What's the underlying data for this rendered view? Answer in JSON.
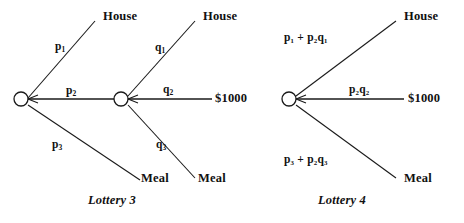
{
  "figure": {
    "background_color": "#ffffff",
    "line_color": "#1a1a1a",
    "text_color": "#111111"
  },
  "lottery3": {
    "caption": "Lottery 3",
    "branches": {
      "top": {
        "prob": "p",
        "prob_sub": "1",
        "outcome": "House"
      },
      "middle": {
        "prob": "p",
        "prob_sub": "2",
        "outcome": ""
      },
      "bottom": {
        "prob": "p",
        "prob_sub": "3",
        "outcome": "Meal"
      }
    },
    "subtree": {
      "top": {
        "prob": "q",
        "prob_sub": "1",
        "outcome": "House"
      },
      "middle": {
        "prob": "q",
        "prob_sub": "2",
        "outcome": "$1000"
      },
      "bottom": {
        "prob": "q",
        "prob_sub": "3",
        "outcome": "Meal"
      }
    }
  },
  "lottery4": {
    "caption": "Lottery 4",
    "branches": {
      "top": {
        "prob_html": "p₁ + p₂q₁",
        "outcome": "House"
      },
      "middle": {
        "prob_html": "p₂q₂",
        "outcome": "$1000"
      },
      "bottom": {
        "prob_html": "p₃ + p₂q₃",
        "outcome": "Meal"
      }
    }
  },
  "labels": {
    "l3_p1": "p",
    "l3_p1_sub": "1",
    "l3_p2": "p",
    "l3_p2_sub": "2",
    "l3_p3": "p",
    "l3_p3_sub": "3",
    "l3_q1": "q",
    "l3_q1_sub": "1",
    "l3_q2": "q",
    "l3_q2_sub": "2",
    "l3_q3": "q",
    "l3_q3_sub": "3",
    "l3_house_mid": "House",
    "l3_meal_mid": "Meal",
    "l3_house_end": "House",
    "l3_money_end": "$1000",
    "l3_meal_end": "Meal",
    "l4_house_end": "House",
    "l4_money_end": "$1000",
    "l4_meal_end": "Meal",
    "l3_caption": "Lottery 3",
    "l4_caption": "Lottery 4"
  }
}
